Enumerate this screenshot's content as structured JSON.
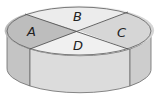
{
  "diagram": {
    "type": "cylinder-divided-into-four-sectors",
    "regions": [
      {
        "id": "A",
        "label": "A",
        "position": "left",
        "fill": "#bdbdbd"
      },
      {
        "id": "B",
        "label": "B",
        "position": "back",
        "fill": "#ececec"
      },
      {
        "id": "C",
        "label": "C",
        "position": "right",
        "fill": "#d6d6d6"
      },
      {
        "id": "D",
        "label": "D",
        "position": "front",
        "fill": "#f0f0f0"
      }
    ],
    "side": {
      "left_fill": "#c4c4c4",
      "front_fill": "#dcdcdc",
      "right_fill": "#cdcdcd"
    },
    "stroke": "#6a6a6a"
  }
}
